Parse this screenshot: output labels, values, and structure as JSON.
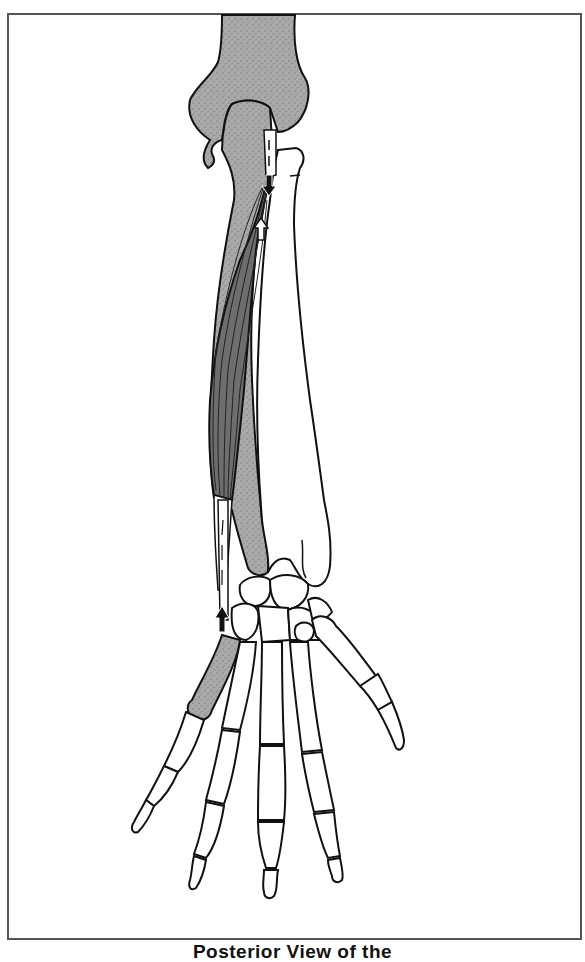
{
  "figure": {
    "caption": "Posterior View of the",
    "colors": {
      "frame": "#555555",
      "bone_highlight": "#a8a8a8",
      "muscle": "#6e6e6e",
      "outline": "#111111",
      "tendon": "#ffffff"
    },
    "structures": [
      "humerus-distal-end",
      "ulna",
      "radius",
      "muscle-belly",
      "tendon",
      "carpals",
      "metacarpals",
      "phalanges",
      "thumb-metacarpal-highlighted"
    ],
    "arrows": [
      {
        "name": "origin-arrow-down",
        "direction": "down"
      },
      {
        "name": "origin-arrow-up",
        "direction": "up"
      },
      {
        "name": "insertion-arrow-up",
        "direction": "up"
      }
    ]
  }
}
